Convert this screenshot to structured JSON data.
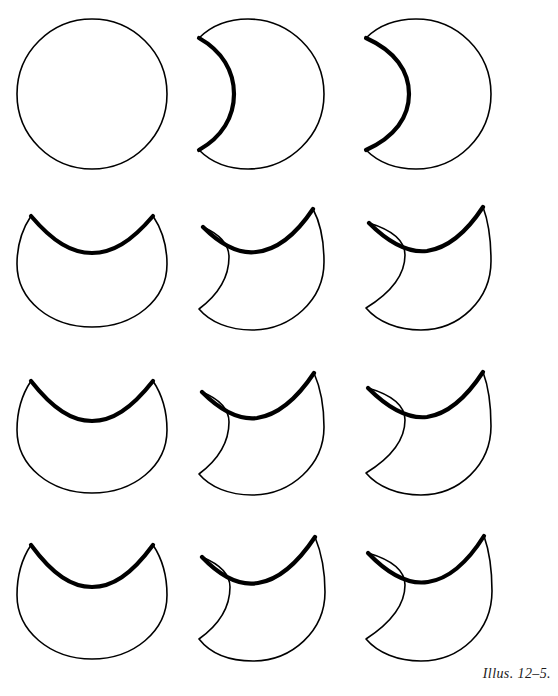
{
  "figure": {
    "caption": "Illus. 12–5.",
    "background_color": "#ffffff",
    "ink_color": "#000000",
    "width": 558,
    "height": 696,
    "rows": 4,
    "columns": 3
  },
  "chart_data": {
    "type": "diagram",
    "title": "Illus. 12–5.",
    "grid": {
      "rows": 4,
      "columns": 3
    },
    "shapes": [
      {
        "id": "r1c1",
        "row": 1,
        "column": 1,
        "name": "full-circle",
        "left_bite_depth": 0,
        "top_bite_depth": 0,
        "x": 16,
        "y": 18,
        "w": 152,
        "h": 152,
        "stroke_width": 1.6,
        "path": "M 92 19 C 133 19 167 52 167 94 C 167 136 133 169 92 169 C 51 169 17 136 17 94 C 17 52 51 19 92 19 Z"
      },
      {
        "id": "r1c2",
        "row": 1,
        "column": 2,
        "name": "crescent-shallow-left",
        "left_bite_depth": 1,
        "top_bite_depth": 0,
        "x": 196,
        "y": 18,
        "w": 134,
        "h": 152,
        "stroke_width": 1.6,
        "path": "M 248 19 C 289 19 324 52 324 94 C 324 136 289 169 248 169 C 228 169 211 162 199 150 C 222 137 234 117 234 94 C 234 71 222 51 199 38 C 211 26 228 19 248 19 Z",
        "thick_edge": "M 199 38 C 222 51 234 71 234 94 C 234 117 222 137 199 150"
      },
      {
        "id": "r1c3",
        "row": 1,
        "column": 3,
        "name": "crescent-deep-left",
        "left_bite_depth": 2,
        "top_bite_depth": 0,
        "x": 362,
        "y": 18,
        "w": 132,
        "h": 152,
        "stroke_width": 1.6,
        "path": "M 416 19 C 457 19 491 52 491 94 C 491 136 457 169 416 169 C 396 169 378 162 366 150 C 395 137 409 117 409 94 C 409 71 395 51 366 38 C 378 26 396 19 416 19 Z",
        "thick_edge": "M 366 38 C 395 51 409 71 409 94 C 409 117 395 137 366 150"
      },
      {
        "id": "r2c1",
        "row": 2,
        "column": 1,
        "name": "top-bite-only",
        "left_bite_depth": 0,
        "top_bite_depth": 1,
        "x": 16,
        "y": 208,
        "w": 152,
        "h": 122,
        "stroke_width": 1.6,
        "path": "M 31 216 C 53 242 72 253 92 253 C 112 253 131 242 153 216 C 163 231 167 248 167 264 C 167 300 134 327 92 327 C 50 327 17 300 17 264 C 17 248 21 231 31 216 Z",
        "thick_edge": "M 31 216 C 53 242 72 253 92 253 C 112 253 131 242 153 216"
      },
      {
        "id": "r2c2",
        "row": 2,
        "column": 2,
        "name": "top-and-left-bite-shallow",
        "left_bite_depth": 1,
        "top_bite_depth": 1,
        "x": 196,
        "y": 205,
        "w": 134,
        "h": 128,
        "stroke_width": 1.6,
        "path": "M 203 227 C 222 246 239 254 256 252 C 276 250 295 236 313 209 C 321 224 324 243 324 262 C 324 300 291 330 252 330 C 229 330 210 322 199 309 C 219 294 229 276 229 257 C 229 243 219 234 203 227 Z",
        "thick_edge": "M 203 227 C 222 246 239 254 256 252 C 276 250 295 236 313 209"
      },
      {
        "id": "r2c3",
        "row": 2,
        "column": 3,
        "name": "top-and-left-bite-deep",
        "left_bite_depth": 2,
        "top_bite_depth": 1,
        "x": 362,
        "y": 205,
        "w": 132,
        "h": 128,
        "stroke_width": 1.6,
        "path": "M 369 223 C 390 244 409 253 427 251 C 447 248 466 233 483 207 C 489 223 491 242 491 261 C 491 300 459 330 421 330 C 398 330 378 322 366 308 C 392 292 405 274 405 255 C 405 240 392 230 369 223 Z",
        "thick_edge": "M 369 223 C 390 244 409 253 427 251 C 447 248 466 233 483 207"
      },
      {
        "id": "r3c1",
        "row": 3,
        "column": 1,
        "name": "top-bite-only-deeper",
        "left_bite_depth": 0,
        "top_bite_depth": 2,
        "x": 16,
        "y": 372,
        "w": 152,
        "h": 124,
        "stroke_width": 1.6,
        "path": "M 31 381 C 53 409 72 421 92 421 C 112 421 131 409 153 381 C 163 396 167 414 167 430 C 167 466 134 493 92 493 C 50 493 17 466 17 430 C 17 414 21 396 31 381 Z",
        "thick_edge": "M 31 381 C 53 409 72 421 92 421 C 112 421 131 409 153 381"
      },
      {
        "id": "r3c2",
        "row": 3,
        "column": 2,
        "name": "top-and-left-bite-shallow-2",
        "left_bite_depth": 1,
        "top_bite_depth": 2,
        "x": 196,
        "y": 370,
        "w": 134,
        "h": 128,
        "stroke_width": 1.6,
        "path": "M 202 392 C 222 412 240 420 257 418 C 277 415 296 400 314 373 C 321 389 324 408 324 427 C 324 465 291 495 252 495 C 229 495 210 487 199 474 C 219 459 229 441 229 422 C 229 408 219 399 202 392 Z",
        "thick_edge": "M 202 392 C 222 412 240 420 257 418 C 277 415 296 400 314 373"
      },
      {
        "id": "r3c3",
        "row": 3,
        "column": 3,
        "name": "top-and-left-bite-deep-2",
        "left_bite_depth": 2,
        "top_bite_depth": 2,
        "x": 362,
        "y": 370,
        "w": 132,
        "h": 128,
        "stroke_width": 1.6,
        "path": "M 368 388 C 390 410 409 419 427 417 C 447 414 466 398 483 372 C 489 388 491 407 491 426 C 491 465 459 495 421 495 C 398 495 378 487 366 473 C 392 457 405 439 405 420 C 405 405 392 395 368 388 Z",
        "thick_edge": "M 368 388 C 390 410 409 419 427 417 C 447 414 466 398 483 372"
      },
      {
        "id": "r4c1",
        "row": 4,
        "column": 1,
        "name": "top-bite-only-deepest",
        "left_bite_depth": 0,
        "top_bite_depth": 3,
        "x": 16,
        "y": 536,
        "w": 152,
        "h": 126,
        "stroke_width": 1.6,
        "path": "M 31 545 C 53 575 72 587 92 587 C 112 587 131 575 153 545 C 163 560 167 578 167 595 C 167 631 134 659 92 659 C 50 659 17 631 17 595 C 17 578 21 560 31 545 Z",
        "thick_edge": "M 31 545 C 53 575 72 587 92 587 C 112 587 131 575 153 545"
      },
      {
        "id": "r4c2",
        "row": 4,
        "column": 2,
        "name": "top-and-left-bite-shallow-3",
        "left_bite_depth": 1,
        "top_bite_depth": 3,
        "x": 196,
        "y": 534,
        "w": 134,
        "h": 130,
        "stroke_width": 1.6,
        "path": "M 202 557 C 222 578 240 586 258 583 C 278 580 297 564 315 537 C 322 554 325 573 325 592 C 325 631 292 661 253 661 C 229 661 210 653 199 639 C 220 624 230 606 230 587 C 230 573 219 564 202 557 Z",
        "thick_edge": "M 202 557 C 222 578 240 586 258 583 C 278 580 297 564 315 537"
      },
      {
        "id": "r4c3",
        "row": 4,
        "column": 3,
        "name": "top-and-left-bite-deep-3",
        "left_bite_depth": 2,
        "top_bite_depth": 3,
        "x": 362,
        "y": 534,
        "w": 132,
        "h": 130,
        "stroke_width": 1.6,
        "path": "M 368 553 C 390 576 409 585 428 582 C 448 579 467 563 484 536 C 490 553 492 572 492 591 C 492 631 460 661 421 661 C 398 661 378 653 366 639 C 392 622 405 604 405 585 C 405 570 392 560 368 553 Z",
        "thick_edge": "M 368 553 C 390 576 409 585 428 582 C 448 579 467 563 484 536"
      }
    ]
  }
}
